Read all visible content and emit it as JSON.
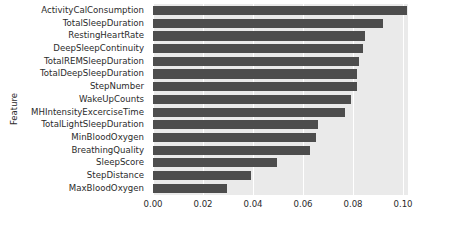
{
  "chart_data": {
    "type": "bar",
    "orientation": "horizontal",
    "title": "",
    "xlabel": "",
    "ylabel": "Feature",
    "xlim": [
      0.0,
      0.102
    ],
    "xticks": [
      "0.00",
      "0.02",
      "0.04",
      "0.06",
      "0.08",
      "0.10"
    ],
    "xtick_values": [
      0.0,
      0.02,
      0.04,
      0.06,
      0.08,
      0.1
    ],
    "grid": true,
    "legend": false,
    "bar_color": "#4d4d4d",
    "plot_background": "#eaeaea",
    "categories": [
      "ActivityCalConsumption",
      "TotalSleepDuration",
      "RestingHeartRate",
      "DeepSleepContinuity",
      "TotalREMSleepDuration",
      "TotalDeepSleepDuration",
      "StepNumber",
      "WakeUpCounts",
      "MHIntensityExcerciseTime",
      "TotalLightSleepDuration",
      "MinBloodOxygen",
      "BreathingQuality",
      "SleepScore",
      "StepDistance",
      "MaxBloodOxygen"
    ],
    "values": [
      0.1016,
      0.092,
      0.0848,
      0.084,
      0.0824,
      0.0816,
      0.0816,
      0.0792,
      0.0768,
      0.066,
      0.0652,
      0.0628,
      0.0496,
      0.0392,
      0.0296
    ]
  }
}
